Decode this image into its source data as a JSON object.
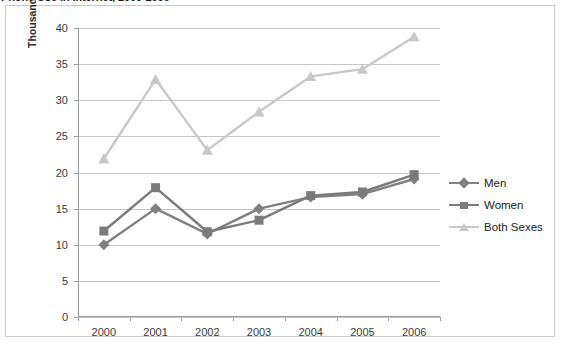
{
  "title": "Phone Use in Internet, 2000-2006",
  "chart_data": {
    "type": "line",
    "title": "Phone Use in Internet, 2000-2006",
    "xlabel": "",
    "ylabel": "Thousands",
    "categories": [
      "2000",
      "2001",
      "2002",
      "2003",
      "2004",
      "2005",
      "2006"
    ],
    "ylim": [
      0,
      40
    ],
    "yticks": [
      0,
      5,
      10,
      15,
      20,
      25,
      30,
      35,
      40
    ],
    "ytick_labels": [
      "0",
      "5",
      "10",
      "15",
      "20",
      "25",
      "30",
      "35",
      "40"
    ],
    "grid": "horizontal",
    "legend_position": "right",
    "series": [
      {
        "name": "Men",
        "color": "#808080",
        "marker": "diamond",
        "values": [
          10.0,
          15.0,
          11.5,
          15.0,
          16.6,
          17.0,
          19.1
        ]
      },
      {
        "name": "Women",
        "color": "#7a7a7a",
        "marker": "square",
        "values": [
          11.9,
          17.9,
          11.8,
          13.4,
          16.8,
          17.3,
          19.7
        ]
      },
      {
        "name": "Both Sexes",
        "color": "#c8c8c8",
        "marker": "triangle",
        "values": [
          21.9,
          32.9,
          23.1,
          28.4,
          33.3,
          34.3,
          38.8
        ]
      }
    ]
  },
  "legend": {
    "items": [
      {
        "label": "Men"
      },
      {
        "label": "Women"
      },
      {
        "label": "Both Sexes"
      }
    ]
  },
  "colors": {
    "men": "#808080",
    "women": "#7a7a7a",
    "both": "#c8c8c8",
    "grid": "#c6c6c6",
    "axis": "#9a9a9a",
    "frame": "#c9c9c9",
    "text": "#3a3a3a"
  }
}
